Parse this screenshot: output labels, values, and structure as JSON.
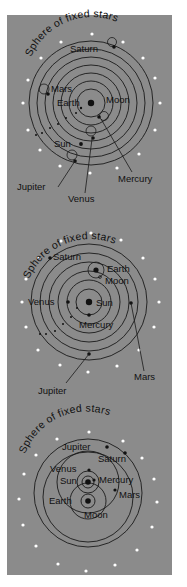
{
  "figure": {
    "background": "#8b8b8b",
    "page_background": "#ffffff",
    "star_color": "#ffffff",
    "ink_color": "#111111"
  },
  "diagrams": [
    {
      "model": "geocentric",
      "arc_label": "Sphere of fixed stars",
      "center_body": "Earth",
      "labels": {
        "saturn": "Saturn",
        "mars": "Mars",
        "earth": "Earth",
        "moon": "Moon",
        "sun": "Sun",
        "jupiter": "Jupiter",
        "venus": "Venus",
        "mercury": "Mercury"
      }
    },
    {
      "model": "heliocentric",
      "arc_label": "Sphere of fixed stars",
      "center_body": "Sun",
      "labels": {
        "saturn": "Saturn",
        "earth": "Earth",
        "moon": "Moon",
        "venus": "Venus",
        "sun": "Sun",
        "mercury": "Mercury",
        "jupiter": "Jupiter",
        "mars": "Mars"
      }
    },
    {
      "model": "geoheliocentric",
      "arc_label": "Sphere of fixed stars",
      "center_body": "Earth",
      "labels": {
        "jupiter": "Jupiter",
        "saturn": "Saturn",
        "venus": "Venus",
        "sun": "Sun",
        "mercury": "Mercury",
        "mars": "Mars",
        "earth": "Earth",
        "moon": "Moon"
      }
    }
  ]
}
